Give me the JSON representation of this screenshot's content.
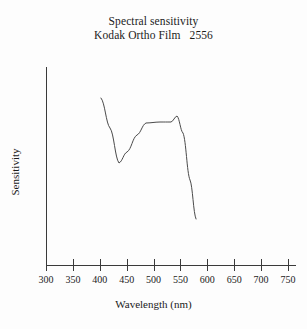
{
  "title": {
    "line1": "Spectral sensitivity",
    "line2": "Kodak Ortho Film   2556"
  },
  "axes": {
    "x_title": "Wavelength (nm)",
    "y_title": "Sensitivity"
  },
  "chart_data": {
    "type": "line",
    "title": "Spectral sensitivity Kodak Ortho Film 2556",
    "xlabel": "Wavelength (nm)",
    "ylabel": "Sensitivity",
    "xlim": [
      300,
      760
    ],
    "ylim": [
      0,
      1
    ],
    "grid": false,
    "legend": null,
    "x_ticks": [
      300,
      350,
      400,
      450,
      500,
      550,
      600,
      650,
      700,
      750
    ],
    "x_tick_labels": [
      "300",
      "350",
      "400",
      "450",
      "500",
      "550",
      "600",
      "650",
      "700",
      "750"
    ],
    "y_ticks": [],
    "y_tick_labels": [],
    "series": [
      {
        "name": "Kodak Ortho Film 2556 spectral sensitivity",
        "x": [
          402,
          410,
          420,
          430,
          437,
          445,
          455,
          465,
          475,
          484,
          495,
          505,
          515,
          525,
          535,
          545,
          552,
          560,
          566,
          572,
          579
        ],
        "y": [
          0.845,
          0.79,
          0.705,
          0.625,
          0.575,
          0.6,
          0.66,
          0.71,
          0.745,
          0.765,
          0.768,
          0.768,
          0.768,
          0.77,
          0.78,
          0.795,
          0.76,
          0.64,
          0.5,
          0.375,
          0.27
        ]
      }
    ],
    "annotations": []
  },
  "geometry": {
    "x_axis_y": 265,
    "y_axis_x": 46,
    "y_axis_top": 67,
    "x_axis_right": 296,
    "px_per_nm": 0.5378,
    "x_origin_nm": 300,
    "tick_length": 6,
    "curve_points_px": "101,98 110,128 119,163 127,152 137,135 146,123 160,122 171,122 177,116 183,133 190,180 196,219"
  }
}
